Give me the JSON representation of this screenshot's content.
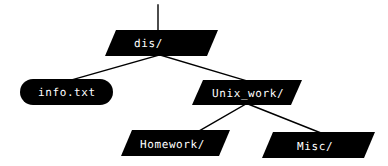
{
  "diagram": {
    "type": "tree",
    "background_color": "#ffffff",
    "node_fill_color": "#000000",
    "node_text_color": "#ffffff",
    "edge_color": "#000000",
    "nodes": [
      {
        "id": "dis",
        "label": "dis/",
        "kind": "directory",
        "shape": "parallelogram",
        "x": 105,
        "y": 30,
        "width": 113,
        "height": 26,
        "skew": 11,
        "label_x": 134,
        "label_y": 38
      },
      {
        "id": "info_txt",
        "label": "info.txt",
        "kind": "file",
        "shape": "rounded-rect",
        "x": 20,
        "y": 79,
        "width": 93,
        "height": 26,
        "radius": 13,
        "label_x": 38,
        "label_y": 87
      },
      {
        "id": "unix_work",
        "label": "Unix_work/",
        "kind": "directory",
        "shape": "parallelogram",
        "x": 192,
        "y": 80,
        "width": 110,
        "height": 25,
        "skew": 11,
        "label_x": 212,
        "label_y": 88
      },
      {
        "id": "homework",
        "label": "Homework/",
        "kind": "directory",
        "shape": "parallelogram",
        "x": 121,
        "y": 130,
        "width": 109,
        "height": 26,
        "skew": 11,
        "label_x": 140,
        "label_y": 139
      },
      {
        "id": "misc",
        "label": "Misc/",
        "kind": "directory",
        "shape": "parallelogram",
        "x": 262,
        "y": 132,
        "width": 113,
        "height": 26,
        "skew": 11,
        "label_x": 297,
        "label_y": 141
      }
    ],
    "edges": [
      {
        "id": "root-stem",
        "from": "parent",
        "to": "dis",
        "x1": 158,
        "y1": 5,
        "x2": 158,
        "y2": 31
      },
      {
        "id": "dis-info",
        "from": "dis",
        "to": "info_txt",
        "x1": 159,
        "y1": 55,
        "x2": 68,
        "y2": 81
      },
      {
        "id": "dis-unixwork",
        "from": "dis",
        "to": "unix_work",
        "x1": 160,
        "y1": 55,
        "x2": 247,
        "y2": 81
      },
      {
        "id": "unixwork-home",
        "from": "unix_work",
        "to": "homework",
        "x1": 246,
        "y1": 104,
        "x2": 199,
        "y2": 131
      },
      {
        "id": "unixwork-misc",
        "from": "unix_work",
        "to": "misc",
        "x1": 248,
        "y1": 104,
        "x2": 321,
        "y2": 133
      }
    ]
  }
}
